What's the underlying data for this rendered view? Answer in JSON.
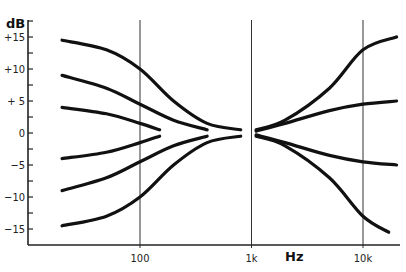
{
  "chart_data": {
    "type": "line",
    "title": "",
    "xlabel": "Hz",
    "ylabel": "dB",
    "xscale": "log",
    "xlim": [
      20,
      20000
    ],
    "ylim": [
      -18,
      17
    ],
    "x_ticks": [
      {
        "value": 100,
        "label": "100"
      },
      {
        "value": 1000,
        "label": "1k"
      },
      {
        "value": 10000,
        "label": "10k"
      }
    ],
    "y_ticks": [
      {
        "value": 15,
        "label": "+15"
      },
      {
        "value": 10,
        "label": "+10"
      },
      {
        "value": 5,
        "label": "+ 5"
      },
      {
        "value": 0,
        "label": "0"
      },
      {
        "value": -5,
        "label": "−5"
      },
      {
        "value": -10,
        "label": "−10"
      },
      {
        "value": -15,
        "label": "−15"
      }
    ],
    "grid": "vertical lines at 100, 1k, 10k",
    "legend": null,
    "series": [
      {
        "name": "bass boost max",
        "x": [
          20,
          50,
          100,
          200,
          400,
          800
        ],
        "values": [
          14.5,
          13,
          10,
          5,
          1.5,
          0.5
        ]
      },
      {
        "name": "bass boost mid",
        "x": [
          20,
          50,
          100,
          200,
          400
        ],
        "values": [
          9,
          7,
          4.5,
          2,
          0.5
        ]
      },
      {
        "name": "bass boost min",
        "x": [
          20,
          50,
          100,
          150
        ],
        "values": [
          4,
          3,
          1.5,
          0.5
        ]
      },
      {
        "name": "bass cut min",
        "x": [
          20,
          50,
          100,
          150
        ],
        "values": [
          -4,
          -3,
          -1.5,
          -0.5
        ]
      },
      {
        "name": "bass cut mid",
        "x": [
          20,
          50,
          100,
          200,
          400
        ],
        "values": [
          -9,
          -7,
          -4.5,
          -2,
          -0.5
        ]
      },
      {
        "name": "bass cut max",
        "x": [
          20,
          50,
          100,
          200,
          400,
          800
        ],
        "values": [
          -14.5,
          -13,
          -10,
          -5,
          -1.5,
          -0.5
        ]
      },
      {
        "name": "treble boost max",
        "x": [
          1100,
          2000,
          5000,
          10000,
          20000
        ],
        "values": [
          0.5,
          2,
          7,
          13,
          15
        ]
      },
      {
        "name": "treble boost min",
        "x": [
          1100,
          2000,
          5000,
          10000,
          20000
        ],
        "values": [
          0.3,
          1.5,
          3.5,
          4.5,
          5
        ]
      },
      {
        "name": "treble cut min",
        "x": [
          1100,
          2000,
          5000,
          10000,
          20000
        ],
        "values": [
          -0.3,
          -1.5,
          -3.5,
          -4.5,
          -5
        ]
      },
      {
        "name": "treble cut max",
        "x": [
          1100,
          2000,
          5000,
          10000,
          17000
        ],
        "values": [
          -0.5,
          -2,
          -7,
          -13,
          -15.5
        ]
      }
    ]
  },
  "axis": {
    "y_title": "dB",
    "x_title": "Hz"
  }
}
